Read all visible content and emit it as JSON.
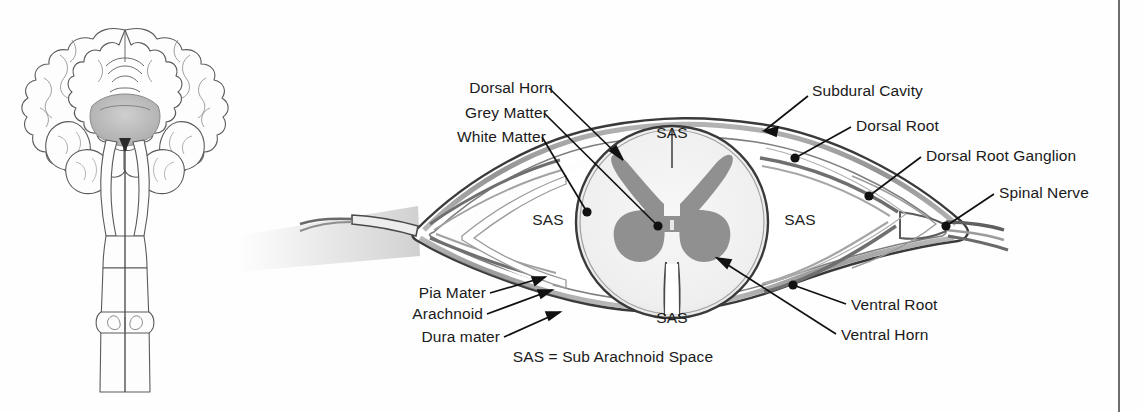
{
  "figure": {
    "background_color": "#fefefe",
    "grey_matter_color": "#909090",
    "white_matter_color": "#f2f2f2",
    "dura_color": "#8a8a8a",
    "outline_color": "#3b3b3b",
    "leader_color": "#111111",
    "rule_color": "#6e6e6e"
  },
  "labels": {
    "dorsal_horn": "Dorsal Horn",
    "grey_matter": "Grey Matter",
    "white_matter": "White Matter",
    "subdural_cavity": "Subdural Cavity",
    "dorsal_root": "Dorsal Root",
    "dorsal_root_ganglion": "Dorsal Root Ganglion",
    "spinal_nerve": "Spinal Nerve",
    "pia_mater": "Pia Mater",
    "arachnoid": "Arachnoid",
    "dura_mater": "Dura mater",
    "ventral_root": "Ventral Root",
    "ventral_horn": "Ventral Horn"
  },
  "sas_markers": {
    "top": "SAS",
    "left": "SAS",
    "right": "SAS",
    "bottom": "SAS"
  },
  "legend": {
    "sas_expansion": "SAS = Sub Arachnoid Space"
  },
  "brain_illustration": {
    "name": "coronal-brain-and-brainstem",
    "parts": [
      "cerebral hemispheres",
      "thalamus",
      "cerebellum",
      "brainstem",
      "spinal cord"
    ]
  }
}
